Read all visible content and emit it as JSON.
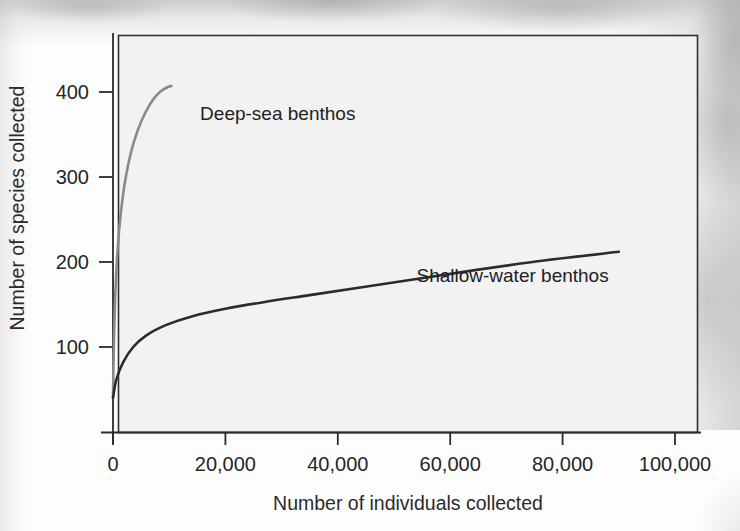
{
  "figure": {
    "source_credit": "Source: Bill Ober",
    "plot_background": "#f2f2f2",
    "frame_color": "#2f2f2f"
  },
  "chart_data": {
    "type": "line",
    "title": "",
    "subtitle": "",
    "xlabel": "Number of individuals collected",
    "ylabel": "Number of species collected",
    "xlim": [
      0,
      105000
    ],
    "ylim": [
      0,
      440
    ],
    "xticks": [
      0,
      20000,
      40000,
      60000,
      80000,
      100000
    ],
    "xticklabels": [
      "0",
      "20,000",
      "40,000",
      "60,000",
      "80,000",
      "100,000"
    ],
    "yticks": [
      100,
      200,
      300,
      400
    ],
    "yticklabels": [
      "100",
      "200",
      "300",
      "400"
    ],
    "grid": false,
    "legend": "inline-annotation",
    "series": [
      {
        "name": "Deep-sea benthos",
        "color": "#8a8a8a",
        "label_x": 15500,
        "label_y": 367,
        "x": [
          0,
          150,
          400,
          800,
          1400,
          2200,
          3200,
          4400,
          5700,
          7100,
          8500,
          9800,
          10400
        ],
        "y": [
          40,
          100,
          160,
          213,
          258,
          297,
          329,
          355,
          375,
          391,
          401,
          406,
          407
        ]
      },
      {
        "name": "Shallow-water benthos",
        "color": "#2b2b2b",
        "label_x": 54000,
        "label_y": 176,
        "x": [
          0,
          600,
          1800,
          3600,
          6000,
          9500,
          14000,
          20000,
          27000,
          35000,
          44000,
          54000,
          65000,
          77000,
          90000
        ],
        "y": [
          40,
          62,
          82,
          100,
          114,
          126,
          136,
          145,
          153,
          161,
          170,
          180,
          191,
          202,
          212
        ]
      }
    ]
  }
}
